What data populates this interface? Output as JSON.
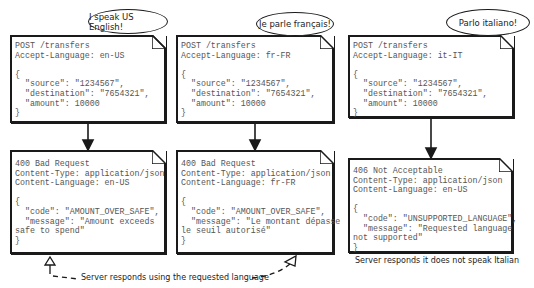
{
  "panels": [
    {
      "speech": "I speak US English!",
      "request": {
        "line1": "POST /transfers",
        "line2": "Accept-Language: en-US",
        "body": "{\n  \"source\": \"1234567\",\n  \"destination\": \"7654321\",\n  \"amount\": 10000\n}"
      },
      "response": {
        "status": "400 Bad Request",
        "content_type": "Content-Type: application/json",
        "content_language": "Content-Language: en-US",
        "body": "{\n  \"code\": \"AMOUNT_OVER_SAFE\",\n  \"message\": \"Amount exceeds\nsafe to spend\"\n}"
      }
    },
    {
      "speech": "Je parle français!",
      "request": {
        "line1": "POST /transfers",
        "line2": "Accept-Language: fr-FR",
        "body": "{\n  \"source\": \"1234567\",\n  \"destination\": \"7654321\",\n  \"amount\": 10000\n}"
      },
      "response": {
        "status": "400 Bad Request",
        "content_type": "Content-Type: application/json",
        "content_language": "Content-Language: fr-FR",
        "body": "{\n  \"code\": \"AMOUNT_OVER_SAFE\",\n  \"message\": \"Le montant dépasse\nle seuil autorisé\"\n}"
      }
    },
    {
      "speech": "Parlo italiano!",
      "request": {
        "line1": "POST /transfers",
        "line2": "Accept-Language: it-IT",
        "body": "{\n  \"source\": \"1234567\",\n  \"destination\": \"7654321\",\n  \"amount\": 10000\n}"
      },
      "response": {
        "status": "406 Not Acceptable",
        "content_type": "Content-Type: application/json",
        "content_language": "Content-Language: en-US",
        "body": "{\n  \"code\": \"UNSUPPORTED_LANGUAGE\",\n  \"message\": \"Requested language\nnot supported\"\n}"
      }
    }
  ],
  "annotations": {
    "requested_language": "Server responds using the requested language",
    "no_italian": "Server responds it does not speak Italian"
  }
}
